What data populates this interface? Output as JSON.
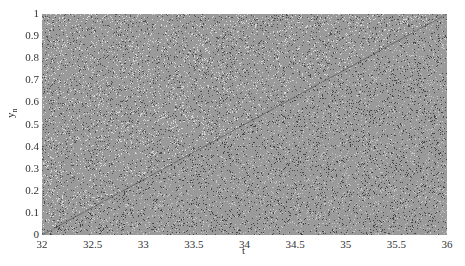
{
  "chart_data": {
    "type": "scatter",
    "title": "",
    "xlabel": "t",
    "ylabel": "y_n",
    "xlim": [
      32,
      36
    ],
    "ylim": [
      0,
      1
    ],
    "xticks": [
      32,
      32.5,
      33,
      33.5,
      34,
      34.5,
      35,
      35.5,
      36
    ],
    "xtick_labels": [
      "32",
      "32.5",
      "33",
      "33.5",
      "34",
      "34.5",
      "35",
      "35.5",
      "36"
    ],
    "yticks": [
      0,
      0.1,
      0.2,
      0.3,
      0.4,
      0.5,
      0.6,
      0.7,
      0.8,
      0.9,
      1
    ],
    "ytick_labels": [
      "0",
      "0.1",
      "0.2",
      "0.3",
      "0.4",
      "0.5",
      "0.6",
      "0.7",
      "0.8",
      "0.9",
      "1"
    ],
    "grid": false,
    "legend": null,
    "diagonal": {
      "x": [
        32,
        36
      ],
      "y": [
        0,
        1
      ]
    },
    "point_color": "#555555"
  }
}
